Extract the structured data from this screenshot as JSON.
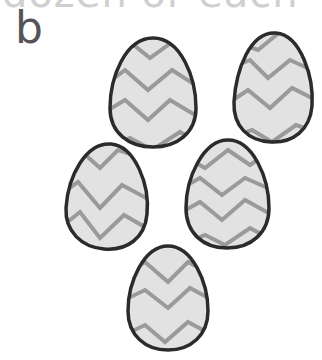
{
  "header": {
    "cut_off_text": "dozen or each"
  },
  "label": "b",
  "illustration": {
    "description": "Five decorated eggs with zigzag patterns",
    "egg_count": 5,
    "colors": {
      "outline": "#2b2b2b",
      "fill": "#e2e2e2",
      "zigzag": "#9a9a9a"
    },
    "eggs": [
      {
        "cx": 153,
        "cy": 93,
        "rx": 43,
        "ry": 55
      },
      {
        "cx": 273,
        "cy": 88,
        "rx": 40,
        "ry": 55
      },
      {
        "cx": 106,
        "cy": 197,
        "rx": 41,
        "ry": 53
      },
      {
        "cx": 227,
        "cy": 194,
        "rx": 41,
        "ry": 54
      },
      {
        "cx": 168,
        "cy": 298,
        "rx": 40,
        "ry": 52
      }
    ]
  }
}
